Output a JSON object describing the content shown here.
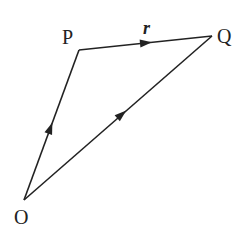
{
  "diagram": {
    "type": "vector-triangle",
    "points": {
      "O": {
        "label": "O",
        "x": 24,
        "y": 200
      },
      "P": {
        "label": "P",
        "x": 79,
        "y": 50
      },
      "Q": {
        "label": "Q",
        "x": 212,
        "y": 36
      }
    },
    "edges": [
      {
        "from": "O",
        "to": "P",
        "arrow": true
      },
      {
        "from": "P",
        "to": "Q",
        "arrow": true,
        "label": "r"
      },
      {
        "from": "O",
        "to": "Q",
        "arrow": true
      }
    ],
    "labels": {
      "O": "O",
      "P": "P",
      "Q": "Q",
      "r": "r"
    },
    "colors": {
      "stroke": "#222222",
      "background": "#ffffff"
    }
  }
}
